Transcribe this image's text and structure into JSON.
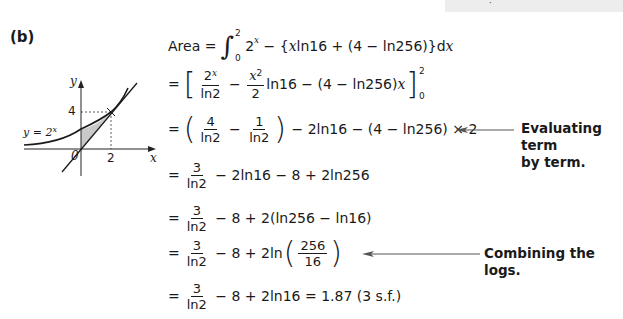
{
  "header": {
    "cut_mark": "·"
  },
  "part_label": "(b)",
  "graph": {
    "curve_label": "y = 2",
    "curve_label_exp": "x",
    "x_axis_label": "x",
    "y_axis_label": "y",
    "origin_label": "0",
    "x_tick": "2",
    "y_tick": "4"
  },
  "lines": {
    "l1": {
      "lhs": "Area",
      "eq": "=",
      "lower": "0",
      "upper": "2",
      "integral": "∫",
      "base": "2",
      "exp": "x",
      "rest": " − {",
      "x1": "x",
      "mid": "ln16 + (4 − ln256)}d",
      "x2": "x"
    },
    "l2": {
      "eq": "=",
      "f1_num_base": "2",
      "f1_num_exp": "x",
      "f1_den": "ln2",
      "minus": "−",
      "f2_num_base": "x",
      "f2_num_exp": "2",
      "f2_den": "2",
      "rest": "ln16 − (4 − ln256)",
      "x": "x",
      "upper": "2",
      "lower": "0"
    },
    "l3": {
      "eq": "=",
      "f1_num": "4",
      "f1_den": "ln2",
      "minus": "−",
      "f2_num": "1",
      "f2_den": "ln2",
      "rest": "− 2ln16 − (4 − ln256) × 2"
    },
    "l4": {
      "eq": "=",
      "num": "3",
      "den": "ln2",
      "rest": "− 2ln16 − 8 + 2ln256"
    },
    "l5": {
      "eq": "=",
      "num": "3",
      "den": "ln2",
      "rest": "− 8 + 2(ln256 − ln16)"
    },
    "l6": {
      "eq": "=",
      "num": "3",
      "den": "ln2",
      "rest": "− 8 + 2ln",
      "inner_num": "256",
      "inner_den": "16"
    },
    "l7": {
      "eq": "=",
      "num": "3",
      "den": "ln2",
      "rest": "− 8 + 2ln16 = 1.87 (3 s.f.)"
    }
  },
  "notes": {
    "n1_line1": "Evaluating term",
    "n1_line2": "by term.",
    "n2": "Combining the logs."
  }
}
